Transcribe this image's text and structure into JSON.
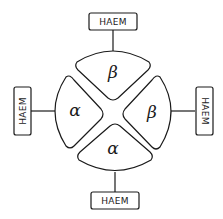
{
  "diagram": {
    "title": "",
    "subunits": [
      {
        "position": "top",
        "label": "β",
        "haem_label": "HAEM"
      },
      {
        "position": "right",
        "label": "β",
        "haem_label": "HAEM"
      },
      {
        "position": "bottom",
        "label": "α",
        "haem_label": "HAEM"
      },
      {
        "position": "left",
        "label": "α",
        "haem_label": "HAEM"
      }
    ],
    "colors": {
      "stroke": "#1a1a1a",
      "fill": "#ffffff"
    }
  }
}
